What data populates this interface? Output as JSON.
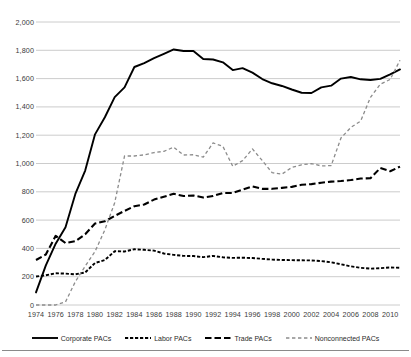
{
  "chart_data": {
    "type": "line",
    "title": "",
    "subtitle": "",
    "xlabel": "",
    "ylabel": "",
    "xlim": [
      1974,
      2011
    ],
    "ylim": [
      0,
      2000
    ],
    "grid": true,
    "grid_axis": "y",
    "legend_position": "bottom",
    "y_ticks": [
      "0",
      "200",
      "400",
      "600",
      "800",
      "1,000",
      "1,200",
      "1,400",
      "1,600",
      "1,800",
      "2,000"
    ],
    "y_tick_values": [
      0,
      200,
      400,
      600,
      800,
      1000,
      1200,
      1400,
      1600,
      1800,
      2000
    ],
    "x_ticks": [
      "1974",
      "1976",
      "1978",
      "1980",
      "1982",
      "1984",
      "1986",
      "1988",
      "1990",
      "1992",
      "1994",
      "1996",
      "1998",
      "2000",
      "2002",
      "2004",
      "2006",
      "2008",
      "2010"
    ],
    "x_tick_values": [
      1974,
      1976,
      1978,
      1980,
      1982,
      1984,
      1986,
      1988,
      1990,
      1992,
      1994,
      1996,
      1998,
      2000,
      2002,
      2004,
      2006,
      2008,
      2010
    ],
    "x": [
      1974,
      1975,
      1976,
      1977,
      1978,
      1979,
      1980,
      1981,
      1982,
      1983,
      1984,
      1985,
      1986,
      1987,
      1988,
      1989,
      1990,
      1991,
      1992,
      1993,
      1994,
      1995,
      1996,
      1997,
      1998,
      1999,
      2000,
      2001,
      2002,
      2003,
      2004,
      2005,
      2006,
      2007,
      2008,
      2009,
      2010,
      2011
    ],
    "series": [
      {
        "name": "Corporate PACs",
        "style": "solid",
        "color": "#000000",
        "values": [
          89,
          280,
          433,
          550,
          785,
          950,
          1206,
          1327,
          1469,
          1538,
          1682,
          1710,
          1744,
          1775,
          1806,
          1795,
          1795,
          1738,
          1735,
          1715,
          1660,
          1674,
          1642,
          1597,
          1567,
          1548,
          1523,
          1500,
          1498,
          1538,
          1550,
          1600,
          1611,
          1595,
          1590,
          1598,
          1630,
          1665
        ]
      },
      {
        "name": "Labor PACs",
        "style": "dotted-dash",
        "color": "#000000",
        "values": [
          201,
          210,
          224,
          222,
          217,
          230,
          297,
          318,
          380,
          378,
          394,
          390,
          384,
          364,
          354,
          347,
          346,
          338,
          347,
          337,
          333,
          334,
          332,
          326,
          321,
          318,
          317,
          316,
          315,
          310,
          302,
          288,
          273,
          263,
          257,
          260,
          265,
          263
        ]
      },
      {
        "name": "Trade PACs",
        "style": "dashed-long",
        "color": "#000000",
        "values": [
          318,
          357,
          489,
          438,
          451,
          500,
          576,
          592,
          629,
          665,
          698,
          710,
          745,
          765,
          786,
          770,
          774,
          760,
          770,
          792,
          792,
          815,
          838,
          821,
          821,
          828,
          835,
          850,
          854,
          864,
          872,
          876,
          883,
          894,
          896,
          968,
          945,
          978
        ]
      },
      {
        "name": "Nonconnected PACs",
        "style": "dashed-gray",
        "color": "#8c8c8c",
        "values": [
          0,
          0,
          0,
          22,
          165,
          274,
          378,
          531,
          723,
          1053,
          1053,
          1061,
          1077,
          1086,
          1115,
          1060,
          1062,
          1045,
          1145,
          1121,
          980,
          1020,
          1103,
          1021,
          935,
          925,
          972,
          991,
          999,
          983,
          985,
          1180,
          1255,
          1300,
          1468,
          1560,
          1594,
          1730
        ]
      }
    ]
  },
  "legend": {
    "items": [
      {
        "label": "Corporate PACs",
        "icon": "solid-line-swatch"
      },
      {
        "label": "Labor PACs",
        "icon": "short-dash-line-swatch"
      },
      {
        "label": "Trade PACs",
        "icon": "long-dash-line-swatch"
      },
      {
        "label": "Nonconnected PACs",
        "icon": "gray-dash-line-swatch"
      }
    ]
  },
  "colors": {
    "series_black": "#000000",
    "series_gray": "#8c8c8c",
    "gridline": "#bfbfbf",
    "tick_text": "#3a3a3a",
    "background": "#ffffff"
  }
}
